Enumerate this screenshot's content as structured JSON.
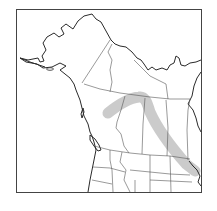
{
  "map": {
    "type": "species-range-map",
    "region": "Northwestern North America (Alaska, western & central Canada, northern United States)",
    "range_color": "#bdbdbd",
    "line_color": "#2a2a2a",
    "background_color": "#ffffff",
    "legend": null,
    "title": null
  }
}
